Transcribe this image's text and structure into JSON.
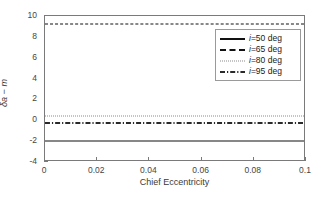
{
  "chart_data": {
    "type": "line",
    "title": "",
    "subtitle": "",
    "xlabel": "Chief Eccentricity",
    "ylabel": "δa − m",
    "xlim": [
      0,
      0.1
    ],
    "ylim": [
      -4,
      10
    ],
    "grid": false,
    "legend_position": "upper right",
    "xticks": [
      0,
      0.02,
      0.04,
      0.06,
      0.08,
      0.1
    ],
    "xtick_labels": [
      "0",
      "0.02",
      "0.04",
      "0.06",
      "0.08",
      "0.1"
    ],
    "yticks": [
      10,
      8,
      6,
      4,
      2,
      0,
      -2,
      -4
    ],
    "ytick_labels": [
      "10",
      "8",
      "6",
      "4",
      "2",
      "0",
      "-2",
      "-4"
    ],
    "x": [
      0,
      0.1
    ],
    "series": [
      {
        "name": "i=50 deg",
        "name_prefix_italic": "i",
        "name_rest": "=50 deg",
        "style": "solid",
        "color": "#111111",
        "values": [
          -1.95,
          -2.05
        ]
      },
      {
        "name": "i=65 deg",
        "name_prefix_italic": "i",
        "name_rest": "=65 deg",
        "style": "dashed",
        "color": "#111111",
        "values": [
          9.25,
          9.2
        ]
      },
      {
        "name": "i=80 deg",
        "name_prefix_italic": "i",
        "name_rest": "=80 deg",
        "style": "dotted",
        "color": "#8c8c8c",
        "values": [
          0.4,
          0.4
        ]
      },
      {
        "name": "i=95 deg",
        "name_prefix_italic": "i",
        "name_rest": "=95 deg",
        "style": "dashdot",
        "color": "#2a2a2a",
        "values": [
          -0.25,
          -0.3
        ]
      }
    ]
  },
  "legend": {
    "entries": [
      {
        "label_italic": "i",
        "label_rest": "=50 deg"
      },
      {
        "label_italic": "i",
        "label_rest": "=65 deg"
      },
      {
        "label_italic": "i",
        "label_rest": "=80 deg"
      },
      {
        "label_italic": "i",
        "label_rest": "=95 deg"
      }
    ]
  },
  "colors": {
    "axis": "#7a7a7a",
    "tick_text": "#454545",
    "label_text": "#3a3a3a",
    "background": "#ffffff",
    "legend_border": "#9a9a9a"
  }
}
